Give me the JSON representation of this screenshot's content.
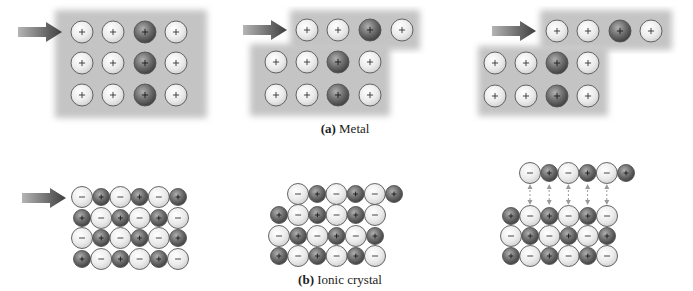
{
  "figure": {
    "captions": {
      "metal": {
        "label": "(a)",
        "text": " Metal"
      },
      "ionic": {
        "label": "(b)",
        "text": " Ionic crystal"
      }
    },
    "colors": {
      "slab": "#c4c4c4",
      "ion_light": "#eeeeee",
      "ion_dark": "#6a6a6a",
      "outline": "#555555",
      "arrow": "#5a5a5a",
      "repulsion_arrow": "#9a9a9a"
    },
    "metal_panels": [
      {
        "name": "metal-panel-initial",
        "slabs": [
          {
            "x": 55,
            "y": 10,
            "w": 152,
            "h": 108
          }
        ],
        "arrow": {
          "x": 18,
          "y": 32
        },
        "rows": [
          {
            "y": 32,
            "x": [
              82,
              113,
              145,
              176
            ]
          },
          {
            "y": 63,
            "x": [
              82,
              113,
              145,
              176
            ]
          },
          {
            "y": 95,
            "x": [
              82,
              113,
              145,
              176
            ]
          }
        ],
        "dark_column": 2
      },
      {
        "name": "metal-panel-shifting",
        "slabs": [
          {
            "x": 290,
            "y": 10,
            "w": 130,
            "h": 40
          },
          {
            "x": 250,
            "y": 44,
            "w": 140,
            "h": 72
          }
        ],
        "arrow": {
          "x": 243,
          "y": 30
        },
        "rows": [
          {
            "y": 30,
            "x": [
              307,
              338,
              370,
              402
            ]
          },
          {
            "y": 62,
            "x": [
              276,
              307,
              338,
              370
            ]
          },
          {
            "y": 95,
            "x": [
              276,
              307,
              338,
              370
            ]
          }
        ],
        "dark_column": 2
      },
      {
        "name": "metal-panel-shifted",
        "slabs": [
          {
            "x": 540,
            "y": 10,
            "w": 132,
            "h": 40
          },
          {
            "x": 478,
            "y": 46,
            "w": 130,
            "h": 70
          }
        ],
        "arrow": {
          "x": 492,
          "y": 31
        },
        "rows": [
          {
            "y": 31,
            "x": [
              557,
              588,
              620,
              651
            ]
          },
          {
            "y": 63,
            "x": [
              495,
              526,
              557,
              588
            ]
          },
          {
            "y": 96,
            "x": [
              495,
              526,
              557,
              588
            ]
          }
        ],
        "dark_column": 2
      }
    ],
    "ionic_panels": [
      {
        "name": "ionic-panel-initial",
        "arrow": {
          "x": 22,
          "y": 198
        },
        "rows": [
          {
            "y": 197,
            "x0": 82,
            "start": "-"
          },
          {
            "y": 218,
            "x0": 82,
            "start": "+"
          },
          {
            "y": 238,
            "x0": 82,
            "start": "-"
          },
          {
            "y": 259,
            "x0": 82,
            "start": "+"
          }
        ],
        "repulsion": false
      },
      {
        "name": "ionic-panel-shifted",
        "arrow": null,
        "rows": [
          {
            "y": 194,
            "x0": 298,
            "start": "-"
          },
          {
            "y": 215,
            "x0": 279,
            "start": "+"
          },
          {
            "y": 236,
            "x0": 279,
            "start": "-"
          },
          {
            "y": 256,
            "x0": 279,
            "start": "+"
          }
        ],
        "repulsion": false
      },
      {
        "name": "ionic-panel-repulsion",
        "arrow": null,
        "rows": [
          {
            "y": 173,
            "x0": 530,
            "start": "-"
          },
          {
            "y": 216,
            "x0": 511,
            "start": "+"
          },
          {
            "y": 236,
            "x0": 511,
            "start": "-"
          },
          {
            "y": 256,
            "x0": 511,
            "start": "+"
          }
        ],
        "repulsion": true
      }
    ],
    "ionic_layout": {
      "count_per_row": 6,
      "step": 19.2,
      "anion_r": 10.5,
      "cation_r": 8.5
    },
    "metal_layout": {
      "ion_r": 11
    }
  }
}
